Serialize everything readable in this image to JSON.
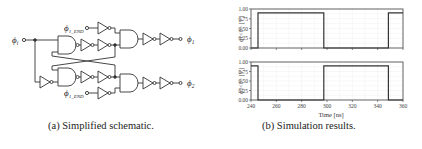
{
  "schematic": {
    "caption": "(a) Simplified schematic.",
    "input_label": "ϕ",
    "input_sub": "i",
    "en1_label": "ϕ",
    "en1_sub": "1_END",
    "en2_label": "ϕ",
    "en2_sub": "1_END",
    "out1_label": "ϕ",
    "out1_sub": "1",
    "out2_label": "ϕ",
    "out2_sub": "2"
  },
  "plots": {
    "caption": "(b) Simulation results.",
    "xlabel": "Time [ns]",
    "top_ylabel": "ϕ1<0> [V]",
    "bottom_ylabel": "ϕ2<0> [V]",
    "yticks": [
      "1.00",
      "0.75",
      "0.50",
      "0.25",
      "0.00"
    ],
    "xticks": [
      "240",
      "260",
      "280",
      "300",
      "320",
      "340",
      "360"
    ]
  },
  "chart_data": [
    {
      "type": "line",
      "title": "",
      "xlabel": "Time [ns]",
      "ylabel": "ϕ1<0> [V]",
      "xlim": [
        240,
        360
      ],
      "ylim": [
        0,
        1.0
      ],
      "grid": true,
      "series": [
        {
          "name": "ϕ1<0>",
          "x": [
            240,
            245.5,
            245.5,
            297.5,
            297.5,
            348.5,
            348.5,
            360
          ],
          "y": [
            0,
            0,
            0.9,
            0.9,
            0,
            0,
            0.9,
            0.9
          ]
        }
      ]
    },
    {
      "type": "line",
      "title": "",
      "xlabel": "Time [ns]",
      "ylabel": "ϕ2<0> [V]",
      "xlim": [
        240,
        360
      ],
      "ylim": [
        0,
        1.0
      ],
      "grid": true,
      "xticks": [
        240,
        260,
        280,
        300,
        320,
        340,
        360
      ],
      "series": [
        {
          "name": "ϕ2<0>",
          "x": [
            240,
            245.5,
            245.5,
            297.5,
            297.5,
            348.5,
            348.5,
            360
          ],
          "y": [
            0.9,
            0.9,
            0,
            0,
            0.9,
            0.9,
            0,
            0
          ]
        }
      ]
    }
  ]
}
